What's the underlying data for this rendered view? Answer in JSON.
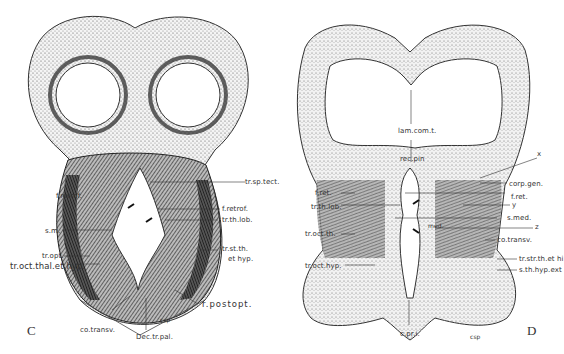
{
  "figure": {
    "panels": [
      {
        "letter": "C",
        "labels": {
          "tr_sp_tect": "tr.sp.tect.",
          "f_retrof_left": "f.retrof.",
          "f_retrof_right": "f.retrof.",
          "tr_th_lob": "tr.th.lob.",
          "s_m": "s.m.",
          "tr_opt": "tr.opt.",
          "tr_oct_thal_et_hyp": "tr.oct.thal.et hyp.",
          "tr_st_th": "tr.st.th.",
          "et_hyp": "et hyp.",
          "r_postopt": "r.postopt.",
          "co_transv": "co.transv.",
          "dec_tr_pal": "Dec.tr.pal.",
          "signature": "csp"
        }
      },
      {
        "letter": "D",
        "labels": {
          "lam_com_t": "lam.com.t.",
          "rec_pin": "rec.pin",
          "x": "x",
          "f_ret_left": "f.ret.",
          "tr_th_lob": "tr.th.lob.",
          "tr_oct_th": "tr.oct.th.",
          "tr_oct_hyp": "tr.oct.hyp.",
          "corp_gen": "corp.gen.",
          "f_ret_right": "f.ret.",
          "y": "y",
          "s_med": "s.med.",
          "med": "med.",
          "z": "z",
          "co_transv": "co.transv.",
          "tr_str_th_et_hi": "tr.str.th.et hi",
          "s_th_hyp_ext": "s.th.hyp.ext",
          "c_pr_i": "c.pr.i.",
          "signature": "csp"
        }
      }
    ]
  }
}
